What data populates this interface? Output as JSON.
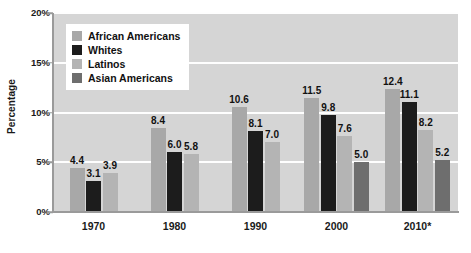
{
  "chart_data": {
    "type": "bar",
    "title": "",
    "subtitle": "",
    "xlabel": "",
    "ylabel": "Percentage",
    "categories": [
      "1970",
      "1980",
      "1990",
      "2000",
      "2010*"
    ],
    "ylim": [
      0,
      20
    ],
    "ytick_values": [
      20,
      15,
      10,
      5,
      0
    ],
    "ytick_labels": [
      "20%",
      "15%",
      "10%",
      "5%",
      "0%"
    ],
    "grid": true,
    "legend_position": "upper-left-inside",
    "series": [
      {
        "name": "African Americans",
        "color": "#a8a8a8",
        "values": [
          4.4,
          8.4,
          10.6,
          11.5,
          12.4
        ],
        "labels": [
          "4.4",
          "8.4",
          "10.6",
          "11.5",
          "12.4"
        ]
      },
      {
        "name": "Whites",
        "color": "#1c1c1c",
        "values": [
          3.1,
          6.0,
          8.1,
          9.8,
          11.1
        ],
        "labels": [
          "3.1",
          "6.0",
          "8.1",
          "9.8",
          "11.1"
        ]
      },
      {
        "name": "Latinos",
        "color": "#b4b4b4",
        "values": [
          3.9,
          5.8,
          7.0,
          7.6,
          8.2
        ],
        "labels": [
          "3.9",
          "5.8",
          "7.0",
          "7.6",
          "8.2"
        ]
      },
      {
        "name": "Asian Americans",
        "color": "#6e6e6e",
        "values": [
          null,
          null,
          null,
          5.0,
          5.2
        ],
        "labels": [
          "",
          "",
          "",
          "5.0",
          "5.2"
        ]
      }
    ],
    "plot_background": "#d5d5d5",
    "gridline_color": "#fefefe",
    "figure_background": "#ffffff"
  },
  "legend": {
    "items": [
      {
        "label": "African Americans",
        "color": "#a8a8a8"
      },
      {
        "label": "Whites",
        "color": "#1c1c1c"
      },
      {
        "label": "Latinos",
        "color": "#b4b4b4"
      },
      {
        "label": "Asian Americans",
        "color": "#6e6e6e"
      }
    ]
  }
}
